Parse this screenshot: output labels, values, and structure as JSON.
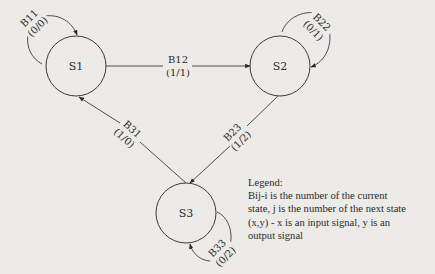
{
  "diagram": {
    "type": "state-transition-diagram",
    "states": [
      {
        "id": "S1",
        "label": "S1"
      },
      {
        "id": "S2",
        "label": "S2"
      },
      {
        "id": "S3",
        "label": "S3"
      }
    ],
    "transitions": [
      {
        "from": "S1",
        "to": "S1",
        "name": "B11",
        "signal": "(0/0)"
      },
      {
        "from": "S1",
        "to": "S2",
        "name": "B12",
        "signal": "(1/1)"
      },
      {
        "from": "S2",
        "to": "S2",
        "name": "B22",
        "signal": "(0/1)"
      },
      {
        "from": "S2",
        "to": "S3",
        "name": "B23",
        "signal": "(1/2)"
      },
      {
        "from": "S3",
        "to": "S1",
        "name": "B31",
        "signal": "(1/0)"
      },
      {
        "from": "S3",
        "to": "S3",
        "name": "B33",
        "signal": "(0/2)"
      }
    ],
    "legend": {
      "title": "Legend:",
      "lines": [
        "Bij-i is the number of the current",
        "state, j is the number of the next state",
        "(x,y) - x is an input signal, y is an",
        "output signal"
      ]
    },
    "colors": {
      "background": "#ecebe8",
      "stroke": "#3a3a3a",
      "text": "#2a2a2a"
    }
  }
}
